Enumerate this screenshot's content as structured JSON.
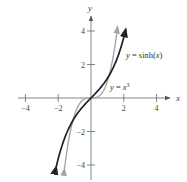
{
  "chart_data": {
    "type": "line",
    "title": "",
    "xlabel": "x",
    "ylabel": "y",
    "xlim": [
      -4.5,
      5
    ],
    "ylim": [
      -4.5,
      5
    ],
    "x_ticks": [
      -4,
      -2,
      2,
      4
    ],
    "x_tick_labels": [
      "−4",
      "−2",
      "2",
      "4"
    ],
    "y_ticks": [
      4,
      2,
      -2,
      -4
    ],
    "y_tick_labels": [
      "4",
      "2",
      "−2",
      "−4"
    ],
    "grid": false,
    "legend": "inline labels",
    "series": [
      {
        "name": "y = sinh(x)",
        "label_text": "y = sinh(x)",
        "color": "#222222",
        "x": [
          -2.1,
          -2.0,
          -1.75,
          -1.5,
          -1.25,
          -1.0,
          -0.75,
          -0.5,
          -0.25,
          0,
          0.25,
          0.5,
          0.75,
          1.0,
          1.25,
          1.5,
          1.75,
          2.0,
          2.1
        ],
        "y": [
          -4.02,
          -3.63,
          -2.79,
          -2.13,
          -1.6,
          -1.18,
          -0.82,
          -0.52,
          -0.25,
          0,
          0.25,
          0.52,
          0.82,
          1.18,
          1.6,
          2.13,
          2.79,
          3.63,
          4.02
        ]
      },
      {
        "name": "y = x^3",
        "label_text": "y = x³",
        "color": "#a6a6a6",
        "x": [
          -1.6,
          -1.5,
          -1.25,
          -1.0,
          -0.75,
          -0.5,
          -0.25,
          0,
          0.25,
          0.5,
          0.75,
          1.0,
          1.25,
          1.5,
          1.6
        ],
        "y": [
          -4.1,
          -3.38,
          -1.95,
          -1.0,
          -0.42,
          -0.125,
          -0.016,
          0,
          0.016,
          0.125,
          0.42,
          1.0,
          1.95,
          3.38,
          4.1
        ]
      }
    ]
  },
  "labels": {
    "x_axis": "x",
    "y_axis": "y",
    "sinh_label": "y = sinh(x)",
    "cube_label_prefix": "y = x",
    "cube_label_exp": "3"
  }
}
